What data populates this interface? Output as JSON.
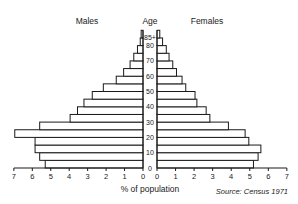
{
  "chart_data": {
    "type": "bar",
    "subtype": "population-pyramid",
    "title": "",
    "xlabel": "% of population",
    "ylabel": "Age",
    "source": "Source: Census 1971",
    "left_label": "Males",
    "right_label": "Females",
    "center_label": "Age",
    "xlim": [
      0,
      7
    ],
    "x_ticks": [
      0,
      1,
      2,
      3,
      4,
      5,
      6,
      7
    ],
    "age_tick_labels": [
      "0",
      "10",
      "20",
      "30",
      "40",
      "50",
      "60",
      "70",
      "80",
      "85+"
    ],
    "categories": [
      "0-4",
      "5-9",
      "10-14",
      "15-19",
      "20-24",
      "25-29",
      "30-34",
      "35-39",
      "40-44",
      "45-49",
      "50-54",
      "55-59",
      "60-64",
      "65-69",
      "70-74",
      "75-79",
      "80-84",
      "85+"
    ],
    "series": [
      {
        "name": "Males",
        "values": [
          5.3,
          5.6,
          5.85,
          5.85,
          6.95,
          5.6,
          3.95,
          3.55,
          3.2,
          2.75,
          2.15,
          1.45,
          1.05,
          0.7,
          0.5,
          0.3,
          0.15,
          0.1
        ]
      },
      {
        "name": "Females",
        "values": [
          5.2,
          5.45,
          5.6,
          4.95,
          4.75,
          3.85,
          2.85,
          2.65,
          2.15,
          2.05,
          1.55,
          1.35,
          1.05,
          0.85,
          0.65,
          0.5,
          0.3,
          0.15
        ]
      }
    ],
    "grid": false,
    "legend": "none"
  }
}
